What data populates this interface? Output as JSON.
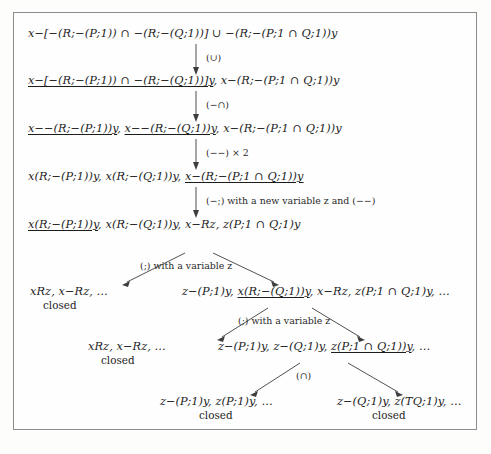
{
  "document": {
    "kind": "tableau-proof-tree",
    "frame_border_color": "#8c8c8c",
    "text_color": "#1d1d1d",
    "background_color": "#fdfdfc"
  },
  "nodes": {
    "root": {
      "id": "node-1",
      "parts": [
        {
          "text": "x−[−(R;−(P;1)) ∩ −(R;−(Q;1))] ∪ −(R;−(P;1 ∩ Q;1))y",
          "underlined": false
        }
      ],
      "full_text": "x−[−(R;−(P;1)) ∩ −(R;−(Q;1))] ∪ −(R;−(P;1 ∩ Q;1))y"
    },
    "level2": {
      "id": "node-2",
      "parts": [
        {
          "text": "x−[−(R;−(P;1)) ∩ −(R;−(Q;1))]y",
          "underlined": true
        },
        {
          "text": ", x−(R;−(P;1 ∩ Q;1))y",
          "underlined": false
        }
      ],
      "full_text": "x−[−(R;−(P;1)) ∩ −(R;−(Q;1))]y, x−(R;−(P;1 ∩ Q;1))y"
    },
    "level3": {
      "id": "node-3",
      "parts": [
        {
          "text": "x−−(R;−(P;1))y",
          "underlined": true
        },
        {
          "text": ", ",
          "underlined": false
        },
        {
          "text": "x−−(R;−(Q;1))y",
          "underlined": true
        },
        {
          "text": ", x−(R;−(P;1 ∩ Q;1))y",
          "underlined": false
        }
      ],
      "full_text": "x−−(R;−(P;1))y, x−−(R;−(Q;1))y, x−(R;−(P;1 ∩ Q;1))y"
    },
    "level4": {
      "id": "node-4",
      "parts": [
        {
          "text": "x(R;−(P;1))y, x(R;−(Q;1))y, ",
          "underlined": false
        },
        {
          "text": "x−(R;−(P;1 ∩ Q;1))y",
          "underlined": true
        }
      ],
      "full_text": "x(R;−(P;1))y, x(R;−(Q;1))y, x−(R;−(P;1 ∩ Q;1))y"
    },
    "level5": {
      "id": "node-5",
      "parts": [
        {
          "text": "x(R;−(P;1))y",
          "underlined": true
        },
        {
          "text": ", x(R;−(Q;1))y, x−Rz, z(P;1 ∩ Q;1)y",
          "underlined": false
        }
      ],
      "full_text": "x(R;−(P;1))y, x(R;−(Q;1))y, x−Rz, z(P;1 ∩ Q;1)y"
    },
    "branch1_left": {
      "id": "node-6",
      "parts": [
        {
          "text": "xRz, x−Rz, …",
          "underlined": false
        }
      ],
      "full_text": "xRz, x−Rz, …",
      "status": "closed"
    },
    "branch1_right": {
      "id": "node-7",
      "parts": [
        {
          "text": "z−(P;1)y, ",
          "underlined": false
        },
        {
          "text": "x(R;−(Q;1))y",
          "underlined": true
        },
        {
          "text": ", x−Rz, z(P;1 ∩ Q;1)y, …",
          "underlined": false
        }
      ],
      "full_text": "z−(P;1)y, x(R;−(Q;1))y, x−Rz, z(P;1 ∩ Q;1)y, …"
    },
    "branch2_left": {
      "id": "node-8",
      "parts": [
        {
          "text": "xRz, x−Rz, …",
          "underlined": false
        }
      ],
      "full_text": "xRz, x−Rz, …",
      "status": "closed"
    },
    "branch2_right": {
      "id": "node-9",
      "parts": [
        {
          "text": "z−(P;1)y, z−(Q;1)y, ",
          "underlined": false
        },
        {
          "text": "z(P;1 ∩ Q;1))y",
          "underlined": true
        },
        {
          "text": ", …",
          "underlined": false
        }
      ],
      "full_text": "z−(P;1)y, z−(Q;1)y, z(P;1 ∩ Q;1))y, …"
    },
    "branch3_left": {
      "id": "node-10",
      "parts": [
        {
          "text": "z−(P;1)y, z(P;1)y, …",
          "underlined": false
        }
      ],
      "full_text": "z−(P;1)y, z(P;1)y, …",
      "status": "closed"
    },
    "branch3_right": {
      "id": "node-11",
      "parts": [
        {
          "text": "z−(Q;1)y, z(TQ;1)y, …",
          "underlined": false
        }
      ],
      "full_text": "z−(Q;1)y, z(TQ;1)y, …",
      "status": "closed"
    }
  },
  "edge_labels": {
    "rule_union": "(∪)",
    "rule_neg_inter": "(−∩)",
    "rule_double_neg": "(−−) × 2",
    "rule_neg_comp": "(−;) with a new variable z and (−−)",
    "rule_comp_1": "(;) with a variable z",
    "rule_comp_2": "(;) with a variable z",
    "rule_inter": "(∩)"
  },
  "status_labels": {
    "closed": "closed"
  }
}
